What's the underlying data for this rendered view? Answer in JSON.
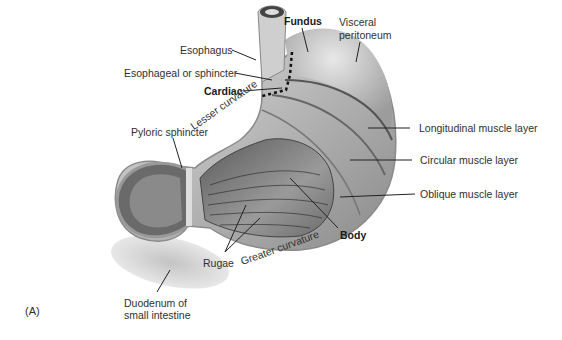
{
  "figure": {
    "panel_label": "(A)",
    "labels": {
      "fundus": "Fundus",
      "visceral_peritoneum_line1": "Visceral",
      "visceral_peritoneum_line2": "peritoneum",
      "esophagus": "Esophagus",
      "esophageal_sphincter": "Esophageal or sphincter",
      "cardiac": "Cardiac",
      "lesser_curvature": "Lesser curvature",
      "pyloric_sphincter": "Pyloric sphincter",
      "longitudinal_muscle": "Longitudinal muscle layer",
      "circular_muscle": "Circular muscle layer",
      "oblique_muscle": "Oblique muscle layer",
      "body": "Body",
      "greater_curvature": "Greater curvature",
      "rugae": "Rugae",
      "duodenum_line1": "Duodenum of",
      "duodenum_line2": "small intestine"
    },
    "colors": {
      "background": "#ffffff",
      "tissue_light": "#d8d8d8",
      "tissue_mid": "#a8a8a8",
      "tissue_dark": "#4a4a4a",
      "leader_line": "#222222"
    }
  }
}
